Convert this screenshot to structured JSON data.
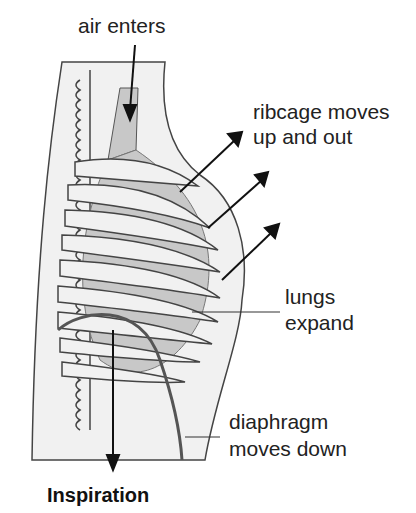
{
  "diagram": {
    "title": "Inspiration",
    "labels": {
      "air": "air enters",
      "ribcage_1": "ribcage moves",
      "ribcage_2": "up and out",
      "lungs_1": "lungs",
      "lungs_2": "expand",
      "diaphragm_1": "diaphragm",
      "diaphragm_2": "moves down"
    },
    "colors": {
      "body": "#f1f1f1",
      "lung": "#c8c8c8",
      "outline": "#333333",
      "diaphragm": "#555555",
      "arrow": "#111111"
    }
  }
}
